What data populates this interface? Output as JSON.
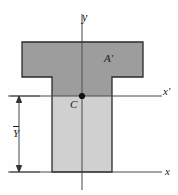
{
  "figure": {
    "kind": "engineering-diagram",
    "background_color": "#fefefe",
    "outline_color": "#2a2a2a",
    "axis_color": "#3a3a3a",
    "fill_upper_color": "#9d9d9d",
    "fill_lower_color": "#cfcfcf",
    "centroid_dot_color": "#111111"
  },
  "labels": {
    "y_axis": "y",
    "x_prime_axis": "x",
    "x_prime_axis_prime": "'",
    "x_axis": "x",
    "area": "A",
    "area_prime": "'",
    "centroid": "C",
    "ybar": "Y"
  },
  "geometry": {
    "flange_left_x": 22,
    "flange_right_x": 143,
    "flange_top_y": 42,
    "flange_bottom_y": 77,
    "web_left_x": 52,
    "web_right_x": 112,
    "web_bottom_y": 172,
    "y_axis_x": 82,
    "y_axis_top_y": 14,
    "y_axis_bottom_y": 190,
    "x_prime_axis_y": 96,
    "x_prime_axis_left_x": 8,
    "x_prime_axis_right_x": 162,
    "x_axis_y": 172,
    "x_axis_left_x": 8,
    "x_axis_right_x": 162,
    "centroid_x": 82,
    "centroid_y": 96,
    "dimension_line_x": 19,
    "dimension_top_y": 96,
    "dimension_bottom_y": 172
  }
}
